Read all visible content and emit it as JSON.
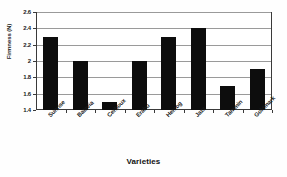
{
  "chart_data": {
    "type": "bar",
    "title": "",
    "xlabel": "Varieties",
    "ylabel": "Firmness (N)",
    "categories": [
      "Sunrise",
      "Batavia",
      "Cerboux",
      "Erabu",
      "Herzog",
      "Jazz",
      "Tammin",
      "Goldmark"
    ],
    "values": [
      2.3,
      2.0,
      1.5,
      2.0,
      2.3,
      2.4,
      1.7,
      1.9
    ],
    "ylim": [
      1.4,
      2.6
    ],
    "yticks": [
      "1.4",
      "1.6",
      "1.8",
      "2",
      "2.2",
      "2.4",
      "2.6"
    ],
    "ytick_values": [
      1.4,
      1.6,
      1.8,
      2.0,
      2.2,
      2.4,
      2.6
    ],
    "grid": true,
    "legend": "none",
    "bar_color": "#0d0d0d",
    "axis_color": "#3a3a3a",
    "grid_color": "#9a9a9a",
    "background": "#ffffff"
  }
}
